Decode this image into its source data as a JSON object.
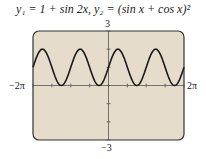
{
  "chart_data": {
    "type": "line",
    "title": "y₁ = 1 + sin 2x,  y₂ = (sin x + cos x)²",
    "series": [
      {
        "name": "y1",
        "expression": "1 + sin 2x"
      },
      {
        "name": "y2",
        "expression": "(sin x + cos x)^2"
      }
    ],
    "xlim": [
      -6.2832,
      6.2832
    ],
    "ylim": [
      -3,
      3
    ],
    "x_tick_labels": {
      "min": "−2π",
      "max": "2π"
    },
    "y_tick_labels": {
      "min": "−3",
      "max": "3"
    },
    "x_scale_ticks": "π/2 spacing",
    "y_scale_ticks": 1,
    "grid": false,
    "legend": "none",
    "colors": {
      "screen": "#e6dccb",
      "curve": "#1a1a1a",
      "frame": "#333333"
    }
  },
  "labels": {
    "title_y1": "y",
    "title_full": "y₁ = 1 + sin 2x,  y₂ = (sin x + cos x)²",
    "ymax": "3",
    "ymin": "−3",
    "xmin": "−2π",
    "xmax": "2π"
  }
}
